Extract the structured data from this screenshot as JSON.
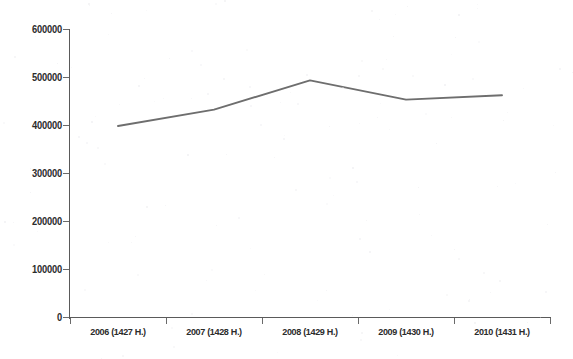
{
  "chart_data": {
    "type": "line",
    "title": "",
    "subtitle": "",
    "xlabel": "",
    "ylabel": "",
    "categories": [
      "2006 (1427 H.)",
      "2007 (1428 H.)",
      "2008 (1429 H.)",
      "2009 (1430 H.)",
      "2010 (1431 H.)"
    ],
    "values": [
      399000,
      433000,
      494000,
      454000,
      463000
    ],
    "series": [
      {
        "name": "",
        "values": [
          399000,
          433000,
          494000,
          454000,
          463000
        ]
      }
    ],
    "ylim": [
      0,
      600000
    ],
    "ytick_labels": [
      "0",
      "100000",
      "200000",
      "300000",
      "400000",
      "500000",
      "600000"
    ],
    "ytick_values": [
      0,
      100000,
      200000,
      300000,
      400000,
      500000,
      600000
    ],
    "grid": false,
    "legend": false,
    "legend_position": "none",
    "line_color": "#6e6e6e",
    "axis_color": "#5a5a5a",
    "text_color": "#2b2b2b",
    "background_color": "#ffffff",
    "markers": false,
    "annotations": []
  }
}
